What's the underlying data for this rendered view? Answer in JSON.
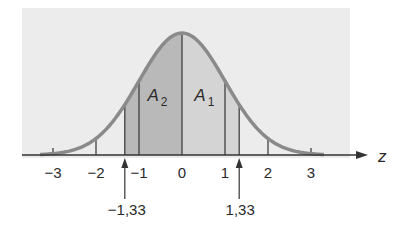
{
  "diagram": {
    "axis_name": "z",
    "ticks": [
      {
        "value": -3,
        "label": "−3"
      },
      {
        "value": -2,
        "label": "−2"
      },
      {
        "value": -1,
        "label": "−1"
      },
      {
        "value": 0,
        "label": "0"
      },
      {
        "value": 1,
        "label": "1"
      },
      {
        "value": 2,
        "label": "2"
      },
      {
        "value": 3,
        "label": "3"
      }
    ],
    "markers": [
      {
        "value": -1.33,
        "label": "−1,33"
      },
      {
        "value": 1.33,
        "label": "1,33"
      }
    ],
    "areas": [
      {
        "name": "A",
        "sub": "2",
        "from": -1.33,
        "to": 0,
        "color": "#b9b9b9"
      },
      {
        "name": "A",
        "sub": "1",
        "from": 0,
        "to": 1.33,
        "color": "#d4d4d4"
      }
    ],
    "colors": {
      "background_panel": "#ececec",
      "curve": "#8a8a8a",
      "lines": "#333333"
    }
  }
}
